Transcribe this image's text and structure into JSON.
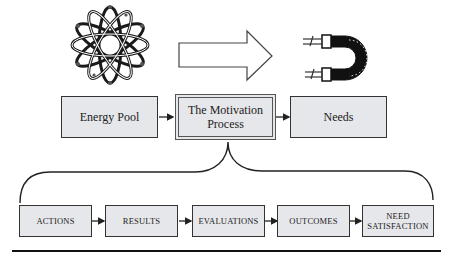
{
  "diagram": {
    "icons": {
      "left": "atom-icon",
      "middle": "right-arrow-icon",
      "right": "horseshoe-magnet-icon"
    },
    "top_row": [
      {
        "label": "Energy Pool"
      },
      {
        "label": "The Motivation Process",
        "line1": "The Motivation",
        "line2": "Process"
      },
      {
        "label": "Needs"
      }
    ],
    "bottom_row": [
      {
        "label": "ACTIONS"
      },
      {
        "label": "RESULTS"
      },
      {
        "label": "EVALUATIONS"
      },
      {
        "label": "OUTCOMES"
      },
      {
        "label": "NEED SATISFACTION",
        "line1": "NEED",
        "line2": "SATISFACTION"
      }
    ],
    "colors": {
      "box_fill": "#e6e7ea",
      "stroke": "#333333"
    }
  }
}
